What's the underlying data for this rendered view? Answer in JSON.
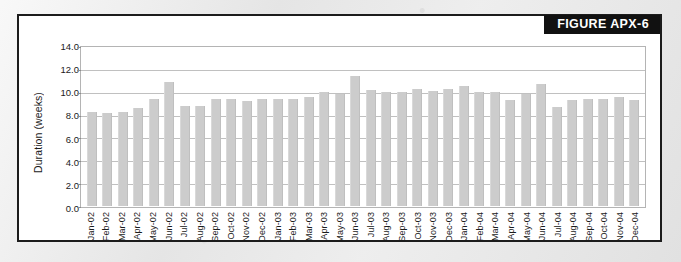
{
  "figure": {
    "title": "FIGURE APX-6",
    "title_bg": "#111111",
    "title_fg": "#ffffff",
    "frame_border": "#1c1c1c",
    "page_bg": "#e4e4e4"
  },
  "chart_data": {
    "type": "bar",
    "title": "FIGURE APX-6",
    "subtitle": "",
    "xlabel": "",
    "ylabel": "Duration (weeks)",
    "ylim": [
      0.0,
      14.0
    ],
    "ytick_step": 2.0,
    "ytick_labels": [
      "0.0",
      "2.0",
      "4.0",
      "6.0",
      "8.0",
      "10.0",
      "12.0",
      "14.0"
    ],
    "ytick_values": [
      0.0,
      2.0,
      4.0,
      6.0,
      8.0,
      10.0,
      12.0,
      14.0
    ],
    "grid": true,
    "grid_axis": "y",
    "legend": false,
    "legend_position": "none",
    "bar_color": "#cccccc",
    "categories": [
      "Jan-02",
      "Feb-02",
      "Mar-02",
      "Apr-02",
      "May-02",
      "Jun-02",
      "Jul-02",
      "Aug-02",
      "Sep-02",
      "Oct-02",
      "Nov-02",
      "Dec-02",
      "Jan-03",
      "Feb-03",
      "Mar-03",
      "Apr-03",
      "May-03",
      "Jun-03",
      "Jul-03",
      "Aug-03",
      "Sep-03",
      "Oct-03",
      "Nov-03",
      "Dec-03",
      "Jan-04",
      "Feb-04",
      "Mar-04",
      "Apr-04",
      "May-04",
      "Jun-04",
      "Jul-04",
      "Aug-04",
      "Sep-04",
      "Oct-04",
      "Nov-04",
      "Dec-04"
    ],
    "values": [
      8.3,
      8.2,
      8.3,
      8.7,
      9.5,
      11.0,
      8.9,
      8.9,
      9.5,
      9.5,
      9.3,
      9.5,
      9.5,
      9.5,
      9.7,
      10.1,
      9.9,
      11.5,
      10.3,
      10.1,
      10.1,
      10.4,
      10.2,
      10.4,
      10.6,
      10.1,
      10.1,
      9.4,
      9.9,
      10.8,
      8.8,
      9.4,
      9.5,
      9.5,
      9.7,
      9.4
    ]
  }
}
